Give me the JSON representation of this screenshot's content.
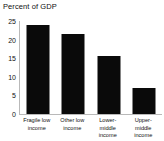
{
  "chart_data": {
    "type": "bar",
    "title": "Percent of GDP",
    "xlabel": "",
    "ylabel": "",
    "categories": [
      "Fragile low income",
      "Other low income",
      "Lower-middle income",
      "Upper-middle income"
    ],
    "values": [
      24.0,
      21.5,
      15.7,
      7.0
    ],
    "ylim": [
      0,
      25
    ],
    "yticks": [
      0,
      5,
      10,
      15,
      20,
      25
    ],
    "ytick_labels": [
      "0",
      "5",
      "10",
      "15",
      "20",
      "25"
    ],
    "grid": false,
    "legend": null,
    "bar_color": "#0a0a0a",
    "axis_color": "#b9b9b9",
    "text_color": "#111111",
    "background": "#ffffff"
  }
}
